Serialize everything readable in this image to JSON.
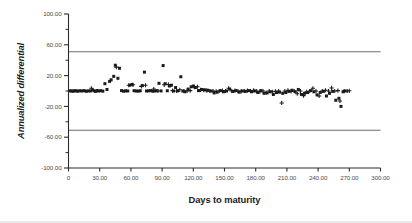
{
  "chart_data": {
    "type": "scatter",
    "title": "",
    "xlabel": "Days to maturity",
    "ylabel": "Annualized differential",
    "xlim": [
      0,
      300
    ],
    "ylim": [
      -100,
      100
    ],
    "grid": false,
    "legend": "none",
    "x_ticks": [
      0,
      30,
      60,
      90,
      120,
      150,
      180,
      210,
      240,
      270,
      300
    ],
    "x_tick_labels": [
      "0",
      "30.00",
      "60.00",
      "90.00",
      "120.00",
      "150.00",
      "180.00",
      "210.00",
      "240.00",
      "270.00",
      "300.00"
    ],
    "y_ticks": [
      -100,
      -60,
      -20,
      20,
      60,
      100
    ],
    "y_tick_labels": [
      "-100.00",
      "-60.00",
      "-20.00",
      "20.00",
      "60.00",
      "100.00"
    ],
    "y_minor_ticks": [
      -80,
      -40,
      0,
      40,
      80
    ],
    "reference_lines": [
      {
        "name": "upper-limit-of-agreement",
        "y": 51.0,
        "color": "#6e6e6e"
      },
      {
        "name": "lower-limit-of-agreement",
        "y": -51.0,
        "color": "#6e6e6e"
      }
    ],
    "series": [
      {
        "name": "square-markers",
        "marker": "square",
        "color": "#1a1a1a",
        "points": [
          [
            1.5,
            0.2
          ],
          [
            3.0,
            0.0
          ],
          [
            4.5,
            -0.3
          ],
          [
            6.0,
            0.4
          ],
          [
            7.5,
            0.1
          ],
          [
            9.0,
            -0.2
          ],
          [
            11.0,
            0.3
          ],
          [
            13.0,
            0.0
          ],
          [
            15.0,
            0.5
          ],
          [
            17.0,
            -0.4
          ],
          [
            19.0,
            0.2
          ],
          [
            21.0,
            0.0
          ],
          [
            23.0,
            1.5
          ],
          [
            24.5,
            0.3
          ],
          [
            26.0,
            -0.5
          ],
          [
            27.5,
            0.6
          ],
          [
            29.0,
            0.0
          ],
          [
            31.0,
            0.4
          ],
          [
            33.0,
            -0.2
          ],
          [
            35.0,
            9.5
          ],
          [
            37.0,
            2.0
          ],
          [
            39.5,
            12.5
          ],
          [
            41.0,
            14.5
          ],
          [
            43.5,
            19.0
          ],
          [
            45.0,
            33.5
          ],
          [
            47.5,
            16.5
          ],
          [
            49.0,
            29.5
          ],
          [
            51.0,
            0.5
          ],
          [
            53.0,
            -0.3
          ],
          [
            55.0,
            0.2
          ],
          [
            57.0,
            0.0
          ],
          [
            59.0,
            7.5
          ],
          [
            61.0,
            8.5
          ],
          [
            63.0,
            0.4
          ],
          [
            65.0,
            0.0
          ],
          [
            67.0,
            -0.2
          ],
          [
            69.0,
            0.3
          ],
          [
            71.0,
            7.0
          ],
          [
            73.0,
            24.5
          ],
          [
            75.0,
            0.0
          ],
          [
            77.0,
            0.2
          ],
          [
            79.0,
            0.5
          ],
          [
            81.0,
            -0.3
          ],
          [
            83.0,
            0.0
          ],
          [
            85.0,
            0.4
          ],
          [
            87.0,
            10.0
          ],
          [
            89.0,
            0.1
          ],
          [
            91.0,
            33.0
          ],
          [
            93.0,
            9.5
          ],
          [
            95.0,
            0.3
          ],
          [
            97.0,
            6.5
          ],
          [
            99.0,
            7.5
          ],
          [
            101.0,
            0.0
          ],
          [
            103.0,
            4.5
          ],
          [
            105.0,
            0.2
          ],
          [
            108.0,
            18.5
          ],
          [
            110.0,
            0.0
          ],
          [
            112.0,
            -1.0
          ],
          [
            115.0,
            2.5
          ],
          [
            118.0,
            5.5
          ],
          [
            120.0,
            6.5
          ],
          [
            122.0,
            4.5
          ],
          [
            125.0,
            0.5
          ],
          [
            128.0,
            2.0
          ],
          [
            131.0,
            1.5
          ],
          [
            134.0,
            1.0
          ],
          [
            137.0,
            0.0
          ],
          [
            140.0,
            -2.5
          ],
          [
            143.0,
            -1.5
          ],
          [
            146.0,
            0.5
          ],
          [
            149.0,
            -1.0
          ],
          [
            152.0,
            0.0
          ],
          [
            155.0,
            2.5
          ],
          [
            158.0,
            -0.5
          ],
          [
            161.0,
            0.5
          ],
          [
            164.0,
            -1.5
          ],
          [
            167.0,
            0.0
          ],
          [
            170.0,
            -0.5
          ],
          [
            173.0,
            0.5
          ],
          [
            176.0,
            -1.0
          ],
          [
            179.0,
            0.0
          ],
          [
            182.0,
            -2.0
          ],
          [
            185.0,
            0.5
          ],
          [
            188.0,
            -3.0
          ],
          [
            191.0,
            -2.5
          ],
          [
            194.0,
            -1.0
          ],
          [
            197.0,
            -4.5
          ],
          [
            200.0,
            -2.0
          ],
          [
            203.0,
            -1.5
          ],
          [
            206.0,
            -3.0
          ],
          [
            209.0,
            -2.0
          ],
          [
            212.0,
            -0.5
          ],
          [
            215.0,
            1.0
          ],
          [
            218.0,
            -1.0
          ],
          [
            221.0,
            2.0
          ],
          [
            224.0,
            -4.5
          ],
          [
            227.0,
            -3.0
          ],
          [
            230.0,
            -2.0
          ],
          [
            233.0,
            0.5
          ],
          [
            236.0,
            -1.0
          ],
          [
            239.0,
            -5.0
          ],
          [
            242.0,
            -2.0
          ],
          [
            245.0,
            -0.5
          ],
          [
            248.0,
            -6.5
          ],
          [
            251.0,
            -3.0
          ],
          [
            254.0,
            -0.5
          ],
          [
            257.0,
            -12.0
          ],
          [
            260.0,
            -9.5
          ],
          [
            262.0,
            -20.0
          ],
          [
            264.0,
            -1.0
          ],
          [
            266.0,
            0.0
          ]
        ]
      },
      {
        "name": "plus-markers",
        "marker": "plus",
        "color": "#1a1a1a",
        "points": [
          [
            22.0,
            3.5
          ],
          [
            46.0,
            31.0
          ],
          [
            58.0,
            7.5
          ],
          [
            62.0,
            8.0
          ],
          [
            70.0,
            6.0
          ],
          [
            74.0,
            7.5
          ],
          [
            82.0,
            2.5
          ],
          [
            86.0,
            0.0
          ],
          [
            92.0,
            8.0
          ],
          [
            96.0,
            8.5
          ],
          [
            100.0,
            0.5
          ],
          [
            104.0,
            0.0
          ],
          [
            107.0,
            1.5
          ],
          [
            111.0,
            0.0
          ],
          [
            114.0,
            0.0
          ],
          [
            117.0,
            0.5
          ],
          [
            121.0,
            5.0
          ],
          [
            124.0,
            5.5
          ],
          [
            127.0,
            1.5
          ],
          [
            130.0,
            1.0
          ],
          [
            133.0,
            0.5
          ],
          [
            136.0,
            0.0
          ],
          [
            139.0,
            0.0
          ],
          [
            142.0,
            -0.5
          ],
          [
            145.0,
            0.0
          ],
          [
            148.0,
            0.5
          ],
          [
            151.0,
            0.0
          ],
          [
            154.0,
            3.5
          ],
          [
            157.0,
            0.0
          ],
          [
            160.0,
            0.5
          ],
          [
            163.0,
            0.0
          ],
          [
            166.0,
            -0.5
          ],
          [
            169.0,
            0.0
          ],
          [
            172.0,
            0.5
          ],
          [
            175.0,
            0.0
          ],
          [
            178.0,
            1.0
          ],
          [
            181.0,
            0.0
          ],
          [
            184.0,
            -1.0
          ],
          [
            187.0,
            0.0
          ],
          [
            190.0,
            -2.0
          ],
          [
            193.0,
            0.0
          ],
          [
            196.0,
            -1.0
          ],
          [
            199.0,
            -0.5
          ],
          [
            202.0,
            0.0
          ],
          [
            205.0,
            -15.5
          ],
          [
            208.0,
            0.0
          ],
          [
            211.0,
            1.0
          ],
          [
            214.0,
            -0.5
          ],
          [
            217.0,
            0.0
          ],
          [
            220.0,
            -3.5
          ],
          [
            223.0,
            0.0
          ],
          [
            226.0,
            -6.0
          ],
          [
            229.0,
            -1.0
          ],
          [
            232.0,
            0.0
          ],
          [
            235.0,
            3.5
          ],
          [
            238.0,
            0.0
          ],
          [
            241.0,
            -6.5
          ],
          [
            244.0,
            0.0
          ],
          [
            247.0,
            1.0
          ],
          [
            250.0,
            0.0
          ],
          [
            253.0,
            4.0
          ],
          [
            256.0,
            0.0
          ],
          [
            259.0,
            0.5
          ],
          [
            261.0,
            -13.0
          ],
          [
            265.0,
            0.0
          ],
          [
            268.0,
            0.0
          ],
          [
            270.0,
            0.2
          ]
        ]
      }
    ]
  },
  "axis": {
    "y_title": "Annualized differential",
    "x_title": "Days to maturity"
  }
}
